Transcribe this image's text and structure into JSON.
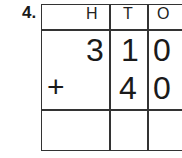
{
  "question_number": "4.",
  "headers": [
    "H",
    "T",
    "O"
  ],
  "rows": [
    {
      "operator": "",
      "digits": [
        "3",
        "1",
        "0"
      ]
    },
    {
      "operator": "+",
      "digits": [
        "",
        "4",
        "0"
      ]
    },
    {
      "operator": "",
      "digits": [
        "",
        "",
        ""
      ]
    }
  ]
}
